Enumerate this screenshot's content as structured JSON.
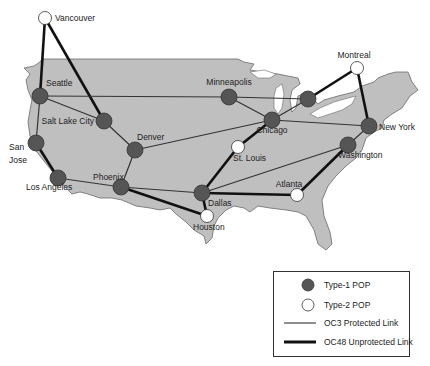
{
  "diagram": {
    "type": "network-map",
    "region": "North America (USA)",
    "colors": {
      "land": "#bfbfbf",
      "land_stroke": "#6a6a6a",
      "type1_fill": "#555555",
      "type2_fill": "#ffffff",
      "link": "#2a2a2a"
    },
    "nodes": [
      {
        "id": "vancouver",
        "label": "Vancouver",
        "type": "type2",
        "x": 45,
        "y": 18
      },
      {
        "id": "seattle",
        "label": "Seattle",
        "type": "type1",
        "x": 40,
        "y": 96
      },
      {
        "id": "saltlake",
        "label": "Salt Lake City",
        "type": "type1",
        "x": 104,
        "y": 121
      },
      {
        "id": "sanjose",
        "label": "San Jose",
        "type": "type1",
        "x": 36,
        "y": 143
      },
      {
        "id": "denver",
        "label": "Denver",
        "type": "type1",
        "x": 135,
        "y": 150
      },
      {
        "id": "losangeles",
        "label": "Los Angeles",
        "type": "type1",
        "x": 58,
        "y": 178
      },
      {
        "id": "phoenix",
        "label": "Phoenix",
        "type": "type1",
        "x": 121,
        "y": 187
      },
      {
        "id": "minneapolis",
        "label": "Minneapolis",
        "type": "type1",
        "x": 229,
        "y": 97
      },
      {
        "id": "detroit",
        "label": "",
        "type": "type1",
        "x": 308,
        "y": 99
      },
      {
        "id": "chicago",
        "label": "Chicago",
        "type": "type1",
        "x": 272,
        "y": 120
      },
      {
        "id": "montreal",
        "label": "Montreal",
        "type": "type2",
        "x": 357,
        "y": 68
      },
      {
        "id": "newyork",
        "label": "New York",
        "type": "type1",
        "x": 369,
        "y": 126
      },
      {
        "id": "stlouis",
        "label": "St. Louis",
        "type": "type2",
        "x": 238,
        "y": 147
      },
      {
        "id": "washington",
        "label": "Washington",
        "type": "type1",
        "x": 348,
        "y": 145
      },
      {
        "id": "dallas",
        "label": "Dallas",
        "type": "type1",
        "x": 202,
        "y": 193
      },
      {
        "id": "atlanta",
        "label": "Atlanta",
        "type": "type2",
        "x": 297,
        "y": 195
      },
      {
        "id": "houston",
        "label": "Houston",
        "type": "type2",
        "x": 207,
        "y": 216
      }
    ],
    "links": [
      {
        "from": "vancouver",
        "to": "seattle",
        "kind": "OC48"
      },
      {
        "from": "vancouver",
        "to": "saltlake",
        "kind": "OC48"
      },
      {
        "from": "seattle",
        "to": "minneapolis",
        "kind": "OC3"
      },
      {
        "from": "seattle",
        "to": "saltlake",
        "kind": "OC3"
      },
      {
        "from": "seattle",
        "to": "sanjose",
        "kind": "OC3"
      },
      {
        "from": "saltlake",
        "to": "denver",
        "kind": "OC3"
      },
      {
        "from": "sanjose",
        "to": "losangeles",
        "kind": "OC48"
      },
      {
        "from": "losangeles",
        "to": "phoenix",
        "kind": "OC3"
      },
      {
        "from": "denver",
        "to": "phoenix",
        "kind": "OC3"
      },
      {
        "from": "denver",
        "to": "chicago",
        "kind": "OC3"
      },
      {
        "from": "phoenix",
        "to": "dallas",
        "kind": "OC3"
      },
      {
        "from": "phoenix",
        "to": "houston",
        "kind": "OC48"
      },
      {
        "from": "minneapolis",
        "to": "detroit",
        "kind": "OC3"
      },
      {
        "from": "minneapolis",
        "to": "chicago",
        "kind": "OC3"
      },
      {
        "from": "detroit",
        "to": "chicago",
        "kind": "OC3"
      },
      {
        "from": "detroit",
        "to": "montreal",
        "kind": "OC48"
      },
      {
        "from": "montreal",
        "to": "newyork",
        "kind": "OC48"
      },
      {
        "from": "chicago",
        "to": "newyork",
        "kind": "OC3"
      },
      {
        "from": "chicago",
        "to": "stlouis",
        "kind": "OC48"
      },
      {
        "from": "stlouis",
        "to": "dallas",
        "kind": "OC48"
      },
      {
        "from": "newyork",
        "to": "washington",
        "kind": "OC3"
      },
      {
        "from": "washington",
        "to": "dallas",
        "kind": "OC3"
      },
      {
        "from": "washington",
        "to": "atlanta",
        "kind": "OC48"
      },
      {
        "from": "dallas",
        "to": "atlanta",
        "kind": "OC48"
      },
      {
        "from": "dallas",
        "to": "houston",
        "kind": "OC48"
      }
    ]
  },
  "legend": {
    "items": [
      {
        "symbol": "type1-pop",
        "label": "Type-1 POP"
      },
      {
        "symbol": "type2-pop",
        "label": "Type-2 POP"
      },
      {
        "symbol": "oc3-link",
        "label": "OC3 Protected Link"
      },
      {
        "symbol": "oc48-link",
        "label": "OC48 Unprotected Link"
      }
    ]
  }
}
